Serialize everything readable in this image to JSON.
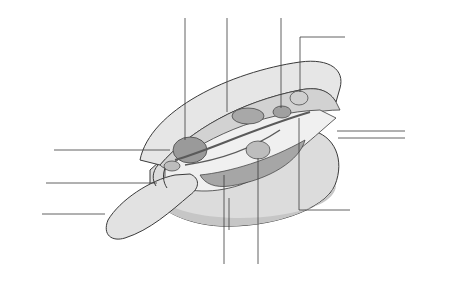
{
  "diagram": {
    "colors": {
      "shell_light": "#e4e4e4",
      "shell_mid": "#cfcfcf",
      "organ_dark": "#9a9a9a",
      "outline": "#3a3a3a",
      "leader": "#3a3a3a",
      "label_text": "#2b2b2b"
    },
    "labels": {
      "stomach": "stomach",
      "heart": "heart",
      "kidney": "kidney",
      "muscle_top": "muscle",
      "exhalent_siphon_line1": "exhalent",
      "exhalent_siphon_line2": "siphon",
      "inhalent_siphon_line1": "inhalent",
      "inhalent_siphon_line2": "siphon",
      "muscle_left": "muscle",
      "palps": "palps",
      "foot": "foot",
      "shell": "shell",
      "gills": "gills",
      "sex_organ": "sex organ",
      "nerve": "nerve"
    }
  }
}
